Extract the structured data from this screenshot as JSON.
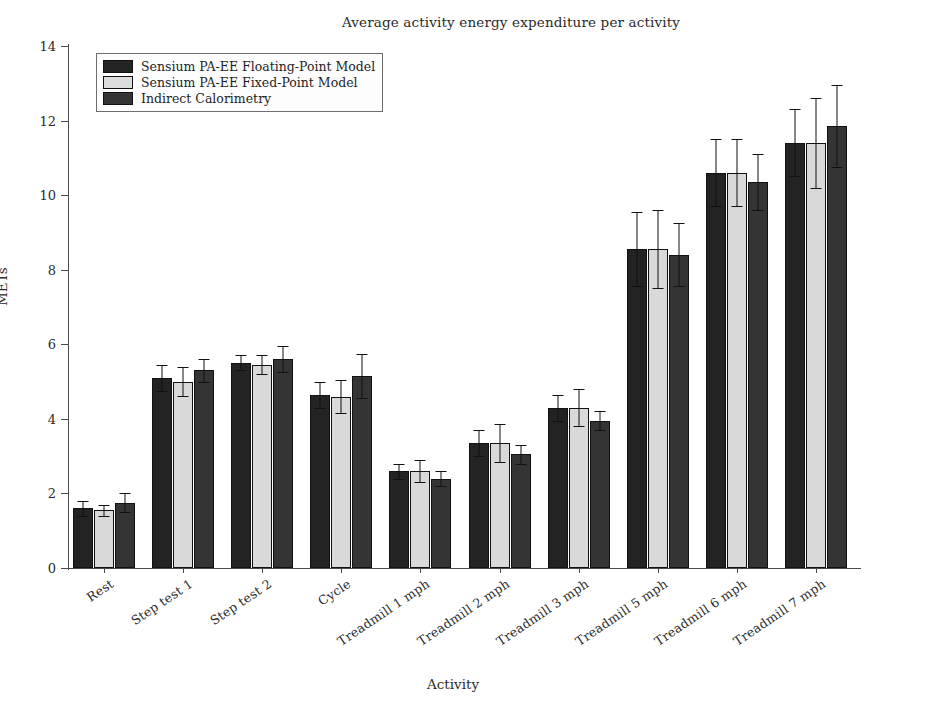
{
  "chart_data": {
    "type": "bar",
    "title": "Average activity energy expenditure per activity",
    "xlabel": "Activity",
    "ylabel": "METs",
    "ylim": [
      0,
      14
    ],
    "yticks": [
      0,
      2,
      4,
      6,
      8,
      10,
      12,
      14
    ],
    "grid": false,
    "legend_position": "upper-left-inside",
    "orientation": "vertical",
    "grouped": true,
    "categories": [
      "Rest",
      "Step test 1",
      "Step test 2",
      "Cycle",
      "Treadmill 1 mph",
      "Treadmill 2 mph",
      "Treadmill 3 mph",
      "Treadmill 5 mph",
      "Treadmill 6 mph",
      "Treadmill 7 mph"
    ],
    "series": [
      {
        "name": "Sensium PA-EE Floating-Point Model",
        "color": "#232323",
        "values": [
          1.6,
          5.1,
          5.5,
          4.65,
          2.6,
          3.35,
          4.3,
          8.55,
          10.6,
          11.4
        ],
        "errors": [
          0.2,
          0.35,
          0.2,
          0.35,
          0.2,
          0.35,
          0.35,
          1.0,
          0.9,
          0.9
        ]
      },
      {
        "name": "Sensium PA-EE Fixed-Point Model",
        "color": "#d9d9d9",
        "values": [
          1.55,
          5.0,
          5.45,
          4.6,
          2.6,
          3.35,
          4.3,
          8.55,
          10.6,
          11.4
        ],
        "errors": [
          0.15,
          0.4,
          0.25,
          0.45,
          0.3,
          0.5,
          0.5,
          1.05,
          0.9,
          1.2
        ]
      },
      {
        "name": "Indirect Calorimetry",
        "color": "#343434",
        "values": [
          1.75,
          5.3,
          5.6,
          5.15,
          2.4,
          3.05,
          3.95,
          8.4,
          10.35,
          11.85
        ],
        "errors": [
          0.25,
          0.3,
          0.35,
          0.6,
          0.2,
          0.25,
          0.25,
          0.85,
          0.75,
          1.1
        ]
      }
    ]
  },
  "legend": {
    "entries": [
      "Sensium PA-EE Floating-Point Model",
      "Sensium PA-EE Fixed-Point Model",
      "Indirect Calorimetry"
    ]
  }
}
